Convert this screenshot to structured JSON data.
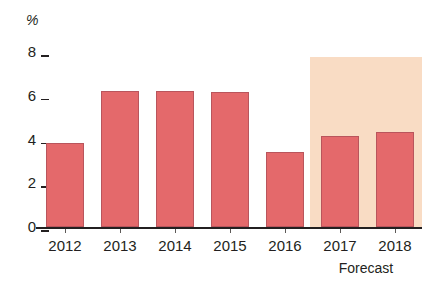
{
  "chart_data": {
    "type": "bar",
    "title": "",
    "subtitle": "",
    "xlabel": "",
    "ylabel": "%",
    "ylim": [
      0,
      8
    ],
    "yticks": [
      0,
      2,
      4,
      6,
      8
    ],
    "ytick_labels": [
      "0",
      "2",
      "4",
      "6",
      "8"
    ],
    "grid": false,
    "legend": null,
    "categories": [
      "2012",
      "2013",
      "2014",
      "2015",
      "2016",
      "2017",
      "2018"
    ],
    "values": [
      3.85,
      6.2,
      6.2,
      6.15,
      3.45,
      4.15,
      4.35
    ],
    "series": [
      {
        "name": "Growth",
        "values": [
          3.85,
          6.2,
          6.2,
          6.15,
          3.45,
          4.15,
          4.35
        ]
      }
    ],
    "annotations": [
      {
        "text": "Forecast",
        "covers": [
          "2017",
          "2018"
        ],
        "position": "below-axis-right"
      }
    ],
    "bar_color": "#e4696b",
    "bar_border_color": "#b9555c",
    "forecast_band_color": "#f9dcc4",
    "axis_color": "#231f20",
    "background_color": "#ffffff"
  },
  "axis": {
    "unit_label": "%",
    "ticks": [
      {
        "label": "8",
        "value": 8
      },
      {
        "label": "6",
        "value": 6
      },
      {
        "label": "4",
        "value": 4
      },
      {
        "label": "2",
        "value": 2
      },
      {
        "label": "0",
        "value": 0
      }
    ]
  },
  "bars": [
    {
      "year": "2012",
      "value": 3.85
    },
    {
      "year": "2013",
      "value": 6.2
    },
    {
      "year": "2014",
      "value": 6.2
    },
    {
      "year": "2015",
      "value": 6.15
    },
    {
      "year": "2016",
      "value": 3.45
    },
    {
      "year": "2017",
      "value": 4.15
    },
    {
      "year": "2018",
      "value": 4.35
    }
  ],
  "forecast": {
    "caption": "Forecast"
  }
}
